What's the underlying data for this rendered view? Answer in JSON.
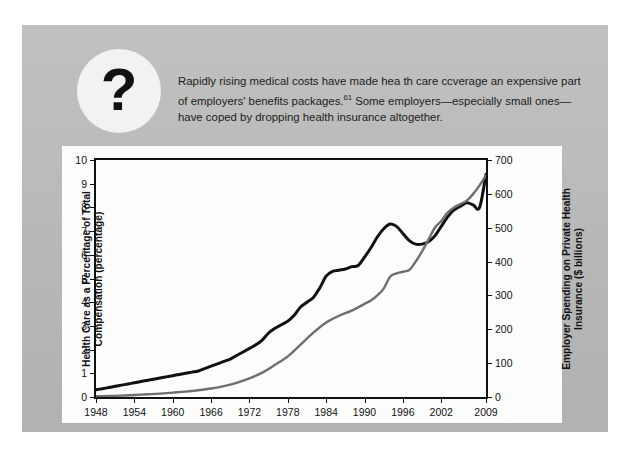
{
  "panel": {
    "icon_label": "?",
    "body_text_part1": "Rapidly rising medical costs have made hea th care ccverage an expensive part of employers' benefits packages.",
    "footnote_marker": "61",
    "body_text_part2": " Some employers—especially small ones—have coped by dropping health insurance altogether."
  },
  "chart_data": {
    "type": "line",
    "title": "",
    "xlabel": "",
    "ylabel": "Health Care as a Percentage of Total Compensation (percentage)",
    "y2label": "Employer Spending on Private Health Insurance ($ billions)",
    "xlim": [
      1948,
      2009
    ],
    "ylim": [
      0,
      10
    ],
    "y2lim": [
      0,
      700
    ],
    "grid": false,
    "legend": "none",
    "xticks": [
      1948,
      1954,
      1960,
      1966,
      1972,
      1978,
      1984,
      1990,
      1996,
      2002,
      2009
    ],
    "xticklabels": [
      "1948",
      "1954",
      "1960",
      "1966",
      "1972",
      "1978",
      "1984",
      "1990",
      "1996",
      "2002",
      "2009"
    ],
    "yticks": [
      0,
      1,
      2,
      3,
      4,
      5,
      6,
      7,
      8,
      9,
      10
    ],
    "yticklabels": [
      "0",
      "1",
      "2",
      "3",
      "4",
      "5",
      "6",
      "7",
      "8",
      "9",
      "10"
    ],
    "y2ticks": [
      0,
      100,
      200,
      300,
      400,
      500,
      600,
      700
    ],
    "y2ticklabels": [
      "0",
      "100",
      "200",
      "300",
      "400",
      "500",
      "600",
      "700"
    ],
    "series": [
      {
        "name": "Health Care as a Percentage of Total Compensation",
        "axis": "left",
        "color": "#111111",
        "x": [
          1948,
          1949,
          1950,
          1951,
          1952,
          1953,
          1954,
          1955,
          1956,
          1957,
          1958,
          1959,
          1960,
          1961,
          1962,
          1963,
          1964,
          1965,
          1966,
          1967,
          1968,
          1969,
          1970,
          1971,
          1972,
          1973,
          1974,
          1975,
          1976,
          1977,
          1978,
          1979,
          1980,
          1981,
          1982,
          1983,
          1984,
          1985,
          1986,
          1987,
          1988,
          1989,
          1990,
          1991,
          1992,
          1993,
          1994,
          1995,
          1996,
          1997,
          1998,
          1999,
          2000,
          2001,
          2002,
          2003,
          2004,
          2005,
          2006,
          2007,
          2008,
          2009
        ],
        "values": [
          0.3,
          0.35,
          0.4,
          0.45,
          0.5,
          0.55,
          0.6,
          0.65,
          0.7,
          0.75,
          0.8,
          0.85,
          0.9,
          0.95,
          1.0,
          1.05,
          1.1,
          1.2,
          1.3,
          1.4,
          1.5,
          1.6,
          1.75,
          1.9,
          2.05,
          2.2,
          2.4,
          2.7,
          2.9,
          3.05,
          3.2,
          3.45,
          3.8,
          4.0,
          4.2,
          4.6,
          5.1,
          5.3,
          5.35,
          5.4,
          5.5,
          5.55,
          5.9,
          6.3,
          6.75,
          7.1,
          7.3,
          7.2,
          6.9,
          6.6,
          6.45,
          6.45,
          6.55,
          6.8,
          7.2,
          7.6,
          7.9,
          8.05,
          8.2,
          8.1,
          8.0,
          9.4
        ]
      },
      {
        "name": "Employer Spending on Private Health Insurance",
        "axis": "right",
        "color": "#6e6e6e",
        "x": [
          1948,
          1950,
          1952,
          1954,
          1956,
          1958,
          1960,
          1962,
          1964,
          1966,
          1968,
          1970,
          1972,
          1974,
          1976,
          1978,
          1980,
          1982,
          1984,
          1986,
          1988,
          1990,
          1991,
          1992,
          1993,
          1994,
          1995,
          1996,
          1997,
          1998,
          1999,
          2000,
          2001,
          2002,
          2003,
          2004,
          2005,
          2006,
          2007,
          2008,
          2009
        ],
        "values": [
          2,
          3,
          4,
          6,
          8,
          10,
          13,
          16,
          20,
          25,
          32,
          42,
          55,
          72,
          95,
          120,
          155,
          190,
          220,
          240,
          255,
          275,
          285,
          300,
          320,
          355,
          365,
          370,
          375,
          400,
          430,
          465,
          500,
          520,
          545,
          560,
          570,
          580,
          600,
          625,
          655
        ]
      }
    ]
  }
}
